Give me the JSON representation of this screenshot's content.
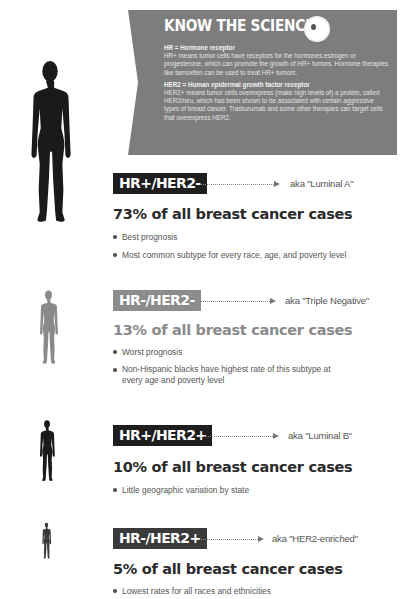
{
  "banner": {
    "title": "KNOW THE SCIENCE",
    "icon": "cell-icon",
    "definitions": [
      {
        "term": "HR = Hormone receptor",
        "text": "HR+ means tumor cells have receptors for the hormones estrogen or progesterone, which can promote the growth of HR+ tumors. Hormone therapies like tamoxifen can be used to treat HR+ tumors."
      },
      {
        "term": "HER2 = Human epidermal growth factor receptor",
        "text": "HER2+ means tumor cells overexpress (make high levels of) a protein, called HER2/neu, which has been shown to be associated with certain aggressive types of breast cancer. Trastuzumab and some other therapies can target cells that overexpress HER2."
      }
    ]
  },
  "subtypes": [
    {
      "badge": "HR+/HER2-",
      "aka": "aka \"Luminal A\"",
      "stat": "73% of all breast cancer cases",
      "percent": 73,
      "bullets": [
        "Best prognosis",
        "Most common subtype for every race, age, and poverty level"
      ],
      "badge_color": "#1e1e1e",
      "figure_color": "#1a1a1a"
    },
    {
      "badge": "HR-/HER2-",
      "aka": "aka \"Triple Negative\"",
      "stat": "13% of all breast cancer cases",
      "percent": 13,
      "bullets": [
        "Worst prognosis",
        "Non-Hispanic blacks have highest rate of this subtype at every age and poverty level"
      ],
      "badge_color": "#8c8c8c",
      "figure_color": "#8a8a8a"
    },
    {
      "badge": "HR+/HER2+",
      "aka": "aka \"Luminal B\"",
      "stat": "10% of all breast cancer cases",
      "percent": 10,
      "bullets": [
        "Little geographic variation by state"
      ],
      "badge_color": "#1e1e1e",
      "figure_color": "#1a1a1a"
    },
    {
      "badge": "HR-/HER2+",
      "aka": "aka \"HER2-enriched\"",
      "stat": "5% of all breast cancer cases",
      "percent": 5,
      "bullets": [
        "Lowest rates for all races and ethnicities"
      ],
      "badge_color": "#3a3a3a",
      "figure_color": "#3a3a3a"
    }
  ]
}
